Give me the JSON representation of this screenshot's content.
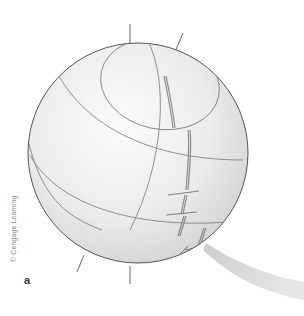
{
  "figure": {
    "panel_label": "a",
    "credit": "© Cengage Learning",
    "colors": {
      "sphere_fill_light": "#f7f7f7",
      "sphere_fill_dark": "#d4d4d4",
      "outline": "#555555",
      "grid_line": "#777777",
      "ridge": "#8a8a8a",
      "plume": "#cfcfcf"
    }
  }
}
